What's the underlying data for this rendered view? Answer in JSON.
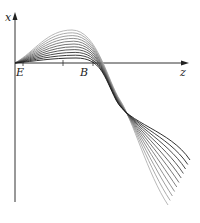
{
  "diagram": {
    "axes": {
      "vertical_label": "x",
      "horizontal_label": "z"
    },
    "points": [
      {
        "label": "E"
      },
      {
        "label": "B"
      }
    ],
    "curve_count": 11,
    "colors": {
      "axis": "#333333",
      "curve_dark": "#1a1a1a",
      "curve_light": "#b0b0b0"
    }
  }
}
